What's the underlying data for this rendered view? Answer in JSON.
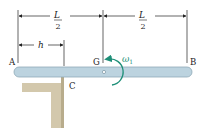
{
  "diagram": {
    "labels": {
      "A": "A",
      "B": "B",
      "G": "G",
      "C": "C",
      "h": "h",
      "L_num_left": "L",
      "L_den_left": "2",
      "L_num_right": "L",
      "L_den_right": "2",
      "omega": "ω",
      "omega_sub": "1"
    },
    "colors": {
      "bar": "#bcd3df",
      "bar_edge": "#8fa9b8",
      "support": "#d8cfb6",
      "support_dark": "#b8ac8c",
      "arrow": "#1e8f78",
      "omega_text": "#1e8f78",
      "dim_line": "#222222"
    }
  }
}
